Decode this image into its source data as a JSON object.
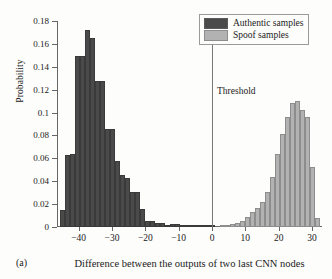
{
  "panel": {
    "label": "(a)"
  },
  "legend": {
    "position": "top-right",
    "items": [
      {
        "label": "Authentic samples",
        "color": "#4a4a4a",
        "key": "authentic"
      },
      {
        "label": "Spoof samples",
        "color": "#b2b2b2",
        "key": "spoof"
      }
    ]
  },
  "annotations": [
    {
      "name": "threshold",
      "label": "Threshold",
      "x": 0
    }
  ],
  "chart_data": {
    "type": "bar",
    "title": "",
    "subtitle": "",
    "xlabel": "Difference between the outputs of two last CNN nodes",
    "ylabel": "Probability",
    "xlim": [
      -46.5,
      33.0
    ],
    "ylim": [
      0,
      0.18
    ],
    "grid": false,
    "legend_position": "top-right",
    "xticks": [
      -40,
      -30,
      -20,
      -10,
      0,
      10,
      20,
      30
    ],
    "xtick_labels": [
      "−40",
      "−30",
      "−20",
      "−10",
      "0",
      "10",
      "20",
      "30"
    ],
    "yticks": [
      0,
      0.02,
      0.04,
      0.06,
      0.08,
      0.1,
      0.12,
      0.14,
      0.16,
      0.18
    ],
    "ytick_labels": [
      "0",
      "0.02",
      "0.04",
      "0.06",
      "0.08",
      "0.1",
      "0.12",
      "0.14",
      "0.16",
      "0.18"
    ],
    "bin_width": 1.5,
    "series": [
      {
        "name": "Authentic samples",
        "key": "authentic",
        "color": "#4a4a4a",
        "bins": [
          {
            "x": -45.0,
            "value": 0.0145
          },
          {
            "x": -43.5,
            "value": 0.063
          },
          {
            "x": -42.0,
            "value": 0.0635
          },
          {
            "x": -40.5,
            "value": 0.1495
          },
          {
            "x": -39.0,
            "value": 0.1495
          },
          {
            "x": -37.5,
            "value": 0.1725
          },
          {
            "x": -36.0,
            "value": 0.1655
          },
          {
            "x": -34.5,
            "value": 0.1275
          },
          {
            "x": -33.0,
            "value": 0.1275
          },
          {
            "x": -31.5,
            "value": 0.0855
          },
          {
            "x": -30.0,
            "value": 0.0855
          },
          {
            "x": -28.5,
            "value": 0.0575
          },
          {
            "x": -27.0,
            "value": 0.0455
          },
          {
            "x": -25.5,
            "value": 0.0425
          },
          {
            "x": -24.0,
            "value": 0.0305
          },
          {
            "x": -22.5,
            "value": 0.0305
          },
          {
            "x": -21.0,
            "value": 0.0155
          },
          {
            "x": -19.5,
            "value": 0.0055
          },
          {
            "x": -18.0,
            "value": 0.0055
          },
          {
            "x": -16.5,
            "value": 0.0035
          },
          {
            "x": -15.0,
            "value": 0.0035
          },
          {
            "x": -13.5,
            "value": 0.0008
          },
          {
            "x": -12.0,
            "value": 0.0022
          },
          {
            "x": -10.5,
            "value": 0.0022
          },
          {
            "x": -9.0,
            "value": 0.0012
          },
          {
            "x": -7.5,
            "value": 0.0012
          },
          {
            "x": -6.0,
            "value": 0.0012
          },
          {
            "x": -4.5,
            "value": 0.0004
          },
          {
            "x": -3.0,
            "value": 0.0004
          },
          {
            "x": -1.5,
            "value": 0.0009
          },
          {
            "x": 0.0,
            "value": 0.0009
          }
        ]
      },
      {
        "name": "Spoof samples",
        "key": "spoof",
        "color": "#b2b2b2",
        "bins": [
          {
            "x": 3.0,
            "value": 0.0008
          },
          {
            "x": 4.5,
            "value": 0.0012
          },
          {
            "x": 6.0,
            "value": 0.0022
          },
          {
            "x": 7.5,
            "value": 0.0035
          },
          {
            "x": 9.0,
            "value": 0.0055
          },
          {
            "x": 10.5,
            "value": 0.0085
          },
          {
            "x": 12.0,
            "value": 0.0135
          },
          {
            "x": 13.5,
            "value": 0.0165
          },
          {
            "x": 15.0,
            "value": 0.0215
          },
          {
            "x": 16.5,
            "value": 0.0305
          },
          {
            "x": 18.0,
            "value": 0.0435
          },
          {
            "x": 19.5,
            "value": 0.0635
          },
          {
            "x": 21.0,
            "value": 0.0815
          },
          {
            "x": 22.5,
            "value": 0.0965
          },
          {
            "x": 24.0,
            "value": 0.1085
          },
          {
            "x": 25.5,
            "value": 0.1105
          },
          {
            "x": 27.0,
            "value": 0.1025
          },
          {
            "x": 28.5,
            "value": 0.0965
          },
          {
            "x": 30.0,
            "value": 0.0525
          },
          {
            "x": 31.5,
            "value": 0.0075
          }
        ]
      }
    ]
  }
}
